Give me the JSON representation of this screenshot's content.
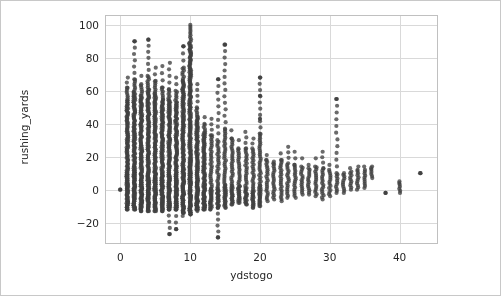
{
  "figure": {
    "background_color": "#ffffff",
    "border_color": "#c8c8c8",
    "width": 501,
    "height": 296
  },
  "chart_data": {
    "type": "scatter",
    "title": "",
    "xlabel": "ydstogo",
    "ylabel": "rushing_yards",
    "xlim": [
      -2.2,
      45.5
    ],
    "ylim": [
      -33,
      106
    ],
    "xticks": [
      0,
      10,
      20,
      30,
      40
    ],
    "xtick_labels": [
      "0",
      "10",
      "20",
      "30",
      "40"
    ],
    "yticks": [
      -20,
      0,
      20,
      40,
      60,
      80,
      100
    ],
    "ytick_labels": [
      "−20",
      "0",
      "20",
      "40",
      "60",
      "80",
      "100"
    ],
    "grid": true,
    "grid_color": "#d9d9d9",
    "legend": null,
    "marker": {
      "shape": "circle",
      "color": "#404040",
      "radius_px": 2.1,
      "alpha": 0.78
    },
    "axes_frame_color": "#c0c0c0",
    "columns": [
      {
        "x": 0,
        "ymin": 0,
        "ymax": 0,
        "count": 1,
        "dense_min": 0,
        "dense_max": 0
      },
      {
        "x": 1,
        "ymin": -12,
        "ymax": 68,
        "count": 62,
        "dense_min": -12,
        "dense_max": 62
      },
      {
        "x": 2,
        "ymin": -12,
        "ymax": 90,
        "count": 96,
        "dense_min": -12,
        "dense_max": 67
      },
      {
        "x": 3,
        "ymin": -13,
        "ymax": 69,
        "count": 92,
        "dense_min": -13,
        "dense_max": 64
      },
      {
        "x": 4,
        "ymin": -13,
        "ymax": 91,
        "count": 88,
        "dense_min": -13,
        "dense_max": 69
      },
      {
        "x": 5,
        "ymin": -13,
        "ymax": 74,
        "count": 92,
        "dense_min": -13,
        "dense_max": 66
      },
      {
        "x": 6,
        "ymin": -13,
        "ymax": 75,
        "count": 86,
        "dense_min": -13,
        "dense_max": 62
      },
      {
        "x": 7,
        "ymin": -27,
        "ymax": 77,
        "count": 84,
        "dense_min": -12,
        "dense_max": 61
      },
      {
        "x": 8,
        "ymin": -24,
        "ymax": 68,
        "count": 80,
        "dense_min": -12,
        "dense_max": 60
      },
      {
        "x": 9,
        "ymin": -16,
        "ymax": 87,
        "count": 88,
        "dense_min": -14,
        "dense_max": 74
      },
      {
        "x": 10,
        "ymin": -15,
        "ymax": 100,
        "count": 150,
        "dense_min": -15,
        "dense_max": 100
      },
      {
        "x": 11,
        "ymin": -13,
        "ymax": 64,
        "count": 60,
        "dense_min": -12,
        "dense_max": 50
      },
      {
        "x": 12,
        "ymin": -12,
        "ymax": 44,
        "count": 52,
        "dense_min": -12,
        "dense_max": 40
      },
      {
        "x": 13,
        "ymin": -12,
        "ymax": 43,
        "count": 48,
        "dense_min": -12,
        "dense_max": 33
      },
      {
        "x": 14,
        "ymin": -29,
        "ymax": 67,
        "count": 46,
        "dense_min": -11,
        "dense_max": 30
      },
      {
        "x": 15,
        "ymin": -11,
        "ymax": 88,
        "count": 44,
        "dense_min": -11,
        "dense_max": 37
      },
      {
        "x": 16,
        "ymin": -9,
        "ymax": 36,
        "count": 40,
        "dense_min": -9,
        "dense_max": 31
      },
      {
        "x": 17,
        "ymin": -8,
        "ymax": 30,
        "count": 36,
        "dense_min": -8,
        "dense_max": 25
      },
      {
        "x": 18,
        "ymin": -9,
        "ymax": 35,
        "count": 34,
        "dense_min": -9,
        "dense_max": 25
      },
      {
        "x": 19,
        "ymin": -11,
        "ymax": 31,
        "count": 32,
        "dense_min": -11,
        "dense_max": 25
      },
      {
        "x": 20,
        "ymin": -10,
        "ymax": 68,
        "count": 44,
        "dense_min": -10,
        "dense_max": 34
      },
      {
        "x": 21,
        "ymin": -7,
        "ymax": 21,
        "count": 20,
        "dense_min": -7,
        "dense_max": 18
      },
      {
        "x": 22,
        "ymin": -6,
        "ymax": 17,
        "count": 18,
        "dense_min": -6,
        "dense_max": 16
      },
      {
        "x": 23,
        "ymin": -7,
        "ymax": 22,
        "count": 18,
        "dense_min": -7,
        "dense_max": 18
      },
      {
        "x": 24,
        "ymin": -5,
        "ymax": 26,
        "count": 16,
        "dense_min": -5,
        "dense_max": 16
      },
      {
        "x": 25,
        "ymin": -5,
        "ymax": 23,
        "count": 16,
        "dense_min": -5,
        "dense_max": 15
      },
      {
        "x": 26,
        "ymin": -3,
        "ymax": 19,
        "count": 12,
        "dense_min": -3,
        "dense_max": 14
      },
      {
        "x": 27,
        "ymin": -3,
        "ymax": 15,
        "count": 12,
        "dense_min": -3,
        "dense_max": 13
      },
      {
        "x": 28,
        "ymin": -4,
        "ymax": 19,
        "count": 12,
        "dense_min": -4,
        "dense_max": 14
      },
      {
        "x": 29,
        "ymin": -6,
        "ymax": 23,
        "count": 12,
        "dense_min": -6,
        "dense_max": 13
      },
      {
        "x": 30,
        "ymin": -4,
        "ymax": 15,
        "count": 10,
        "dense_min": -4,
        "dense_max": 12
      },
      {
        "x": 31,
        "ymin": -2,
        "ymax": 55,
        "count": 9,
        "dense_min": -2,
        "dense_max": 10
      },
      {
        "x": 32,
        "ymin": -2,
        "ymax": 10,
        "count": 8,
        "dense_min": -2,
        "dense_max": 9
      },
      {
        "x": 33,
        "ymin": 0,
        "ymax": 13,
        "count": 7,
        "dense_min": 0,
        "dense_max": 11
      },
      {
        "x": 34,
        "ymin": 0,
        "ymax": 14,
        "count": 7,
        "dense_min": 0,
        "dense_max": 12
      },
      {
        "x": 35,
        "ymin": 1,
        "ymax": 14,
        "count": 6,
        "dense_min": 1,
        "dense_max": 12
      },
      {
        "x": 36,
        "ymin": 7,
        "ymax": 14,
        "count": 3,
        "dense_min": 7,
        "dense_max": 13
      },
      {
        "x": 38,
        "ymin": -2,
        "ymax": -2,
        "count": 1,
        "dense_min": -2,
        "dense_max": -2
      },
      {
        "x": 40,
        "ymin": -2,
        "ymax": 5,
        "count": 4,
        "dense_min": -2,
        "dense_max": 4
      },
      {
        "x": 43,
        "ymin": 10,
        "ymax": 10,
        "count": 1,
        "dense_min": 10,
        "dense_max": 10
      }
    ],
    "outliers": [
      {
        "x": 2,
        "y": 90
      },
      {
        "x": 4,
        "y": 91
      },
      {
        "x": 9,
        "y": 87
      },
      {
        "x": 15,
        "y": 88
      },
      {
        "x": 20,
        "y": 68
      },
      {
        "x": 14,
        "y": 67
      },
      {
        "x": 31,
        "y": 55
      },
      {
        "x": 20,
        "y": 57
      },
      {
        "x": 20,
        "y": 43
      },
      {
        "x": 7,
        "y": -27
      },
      {
        "x": 8,
        "y": -24
      },
      {
        "x": 14,
        "y": -29
      },
      {
        "x": 43,
        "y": 10
      },
      {
        "x": 38,
        "y": -2
      },
      {
        "x": 0,
        "y": 0
      }
    ]
  }
}
